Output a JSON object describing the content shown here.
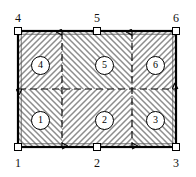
{
  "figure": {
    "type": "structural-panel-diagram",
    "background_color": "#ffffff",
    "line_color": "#000000",
    "hatch_color": "#8a8a8a"
  },
  "panel": {
    "x": 18,
    "y": 31,
    "width": 158,
    "height": 116,
    "border_color": "#000000",
    "border_width": 2,
    "fill": "hatched"
  },
  "centerlines": {
    "style": "dashed",
    "color": "#000000",
    "horizontal": [
      {
        "name": "mid-horizontal",
        "y": 89,
        "x1": 18,
        "x2": 176,
        "arrows": "both"
      }
    ],
    "vertical": [
      {
        "name": "vertical-left",
        "x": 62,
        "y1": 31,
        "y2": 147,
        "arrows": "both"
      },
      {
        "name": "vertical-right",
        "x": 132,
        "y1": 31,
        "y2": 147,
        "arrows": "both"
      }
    ]
  },
  "boundary_nodes": [
    {
      "id": "node-1",
      "label": "1",
      "x": 18,
      "y": 147,
      "label_pos": "below-left"
    },
    {
      "id": "node-2",
      "label": "2",
      "x": 97,
      "y": 147,
      "label_pos": "below"
    },
    {
      "id": "node-3",
      "label": "3",
      "x": 176,
      "y": 147,
      "label_pos": "below-right"
    },
    {
      "id": "node-4",
      "label": "4",
      "x": 18,
      "y": 31,
      "label_pos": "above-left"
    },
    {
      "id": "node-5",
      "label": "5",
      "x": 97,
      "y": 31,
      "label_pos": "above"
    },
    {
      "id": "node-6",
      "label": "6",
      "x": 176,
      "y": 31,
      "label_pos": "above-right"
    }
  ],
  "regions": [
    {
      "id": "region-1",
      "label": "1",
      "cx": 40,
      "cy": 120
    },
    {
      "id": "region-2",
      "label": "2",
      "cx": 104,
      "cy": 120
    },
    {
      "id": "region-3",
      "label": "3",
      "cx": 155,
      "cy": 120
    },
    {
      "id": "region-4",
      "label": "4",
      "cx": 40,
      "cy": 65
    },
    {
      "id": "region-5",
      "label": "5",
      "cx": 104,
      "cy": 65
    },
    {
      "id": "region-6",
      "label": "6",
      "cx": 155,
      "cy": 65
    }
  ]
}
